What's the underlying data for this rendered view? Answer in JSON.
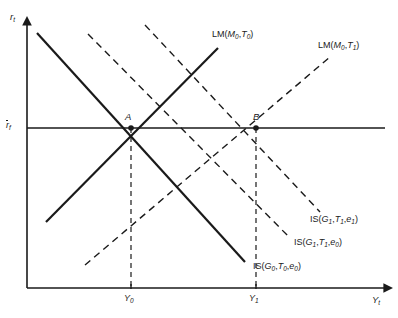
{
  "figure": {
    "type": "is-lm-diagram",
    "background": "#ffffff",
    "line_color": "#1a1a1a"
  },
  "axes": {
    "y_label_main": "r",
    "y_label_sub": "t",
    "x_label_main": "Y",
    "x_label_sub": "t",
    "y_axis_x": 27,
    "x_axis_y": 288,
    "y_axis_top": 20,
    "x_axis_right": 385
  },
  "reference_line": {
    "label_main": "r",
    "label_sub": "f",
    "label_overbar": true,
    "y": 128
  },
  "points": [
    {
      "name": "A",
      "label": "A",
      "x": 131,
      "y": 128,
      "label_dx": -6,
      "label_dy": -16
    },
    {
      "name": "B",
      "label": "B",
      "x": 256,
      "y": 128,
      "label_dx": -3,
      "label_dy": -16
    }
  ],
  "x_ticks": [
    {
      "label_main": "Y",
      "label_sub": "0",
      "x": 131
    },
    {
      "label_main": "Y",
      "label_sub": "1",
      "x": 256
    }
  ],
  "curves": [
    {
      "id": "lm-m0-t0",
      "kind": "LM",
      "style": "solid",
      "x1": 46,
      "y1": 222,
      "x2": 218,
      "y2": 48,
      "label": {
        "prefix": "LM(",
        "terms": [
          [
            "M",
            "0"
          ],
          [
            "T",
            "0"
          ]
        ],
        "suffix": ")",
        "x": 212,
        "y": 30
      }
    },
    {
      "id": "lm-m0-t1",
      "kind": "LM",
      "style": "dashed",
      "x1": 85,
      "y1": 265,
      "x2": 330,
      "y2": 57,
      "label": {
        "prefix": "LM(",
        "terms": [
          [
            "M",
            "0"
          ],
          [
            "T",
            "1"
          ]
        ],
        "suffix": ")",
        "x": 318,
        "y": 41
      }
    },
    {
      "id": "is-g0-t0-e0",
      "kind": "IS",
      "style": "solid",
      "x1": 37,
      "y1": 33,
      "x2": 245,
      "y2": 262,
      "label": {
        "prefix": "IS(",
        "terms": [
          [
            "G",
            "0"
          ],
          [
            "T",
            "0"
          ],
          [
            "e",
            "0"
          ]
        ],
        "suffix": ")",
        "x": 253,
        "y": 262
      }
    },
    {
      "id": "is-g1-t1-e0",
      "kind": "IS",
      "style": "dashed",
      "x1": 88,
      "y1": 34,
      "x2": 290,
      "y2": 238,
      "label": {
        "prefix": "IS(",
        "terms": [
          [
            "G",
            "1"
          ],
          [
            "T",
            "1"
          ],
          [
            "e",
            "0"
          ]
        ],
        "suffix": ")",
        "x": 294,
        "y": 238
      }
    },
    {
      "id": "is-g1-t1-e1",
      "kind": "IS",
      "style": "dashed",
      "x1": 145,
      "y1": 25,
      "x2": 320,
      "y2": 212,
      "label": {
        "prefix": "IS(",
        "terms": [
          [
            "G",
            "1"
          ],
          [
            "T",
            "1"
          ],
          [
            "e",
            "1"
          ]
        ],
        "suffix": ")",
        "x": 310,
        "y": 215
      }
    }
  ],
  "drop_lines": [
    {
      "x": 131,
      "y_top": 128,
      "y_bottom": 288
    },
    {
      "x": 256,
      "y_top": 128,
      "y_bottom": 288
    }
  ]
}
